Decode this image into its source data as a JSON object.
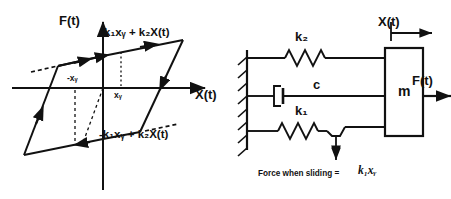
{
  "hysteresis_plot": {
    "y_axis_label": "F(t)",
    "x_axis_label": "X(t)",
    "upper_branch_equation": "k₁xᵧ + k₂X(t)",
    "lower_branch_equation": "-k₁xᵧ + k₂X(t)",
    "tick_negative": "-xᵧ",
    "tick_positive": "xᵧ",
    "loop_shape": "parallelogram",
    "stroke_color": "#111111"
  },
  "schematic": {
    "spring_top_label": "k₂",
    "damper_label": "c",
    "spring_bottom_label": "k₁",
    "mass_label": "m",
    "displacement_label": "X(t)",
    "force_label": "F(t)",
    "caption_text": "Force when sliding =",
    "caption_math": "k₁xᵧ",
    "wall": "fixed-support-hatched",
    "stroke_color": "#111111"
  }
}
